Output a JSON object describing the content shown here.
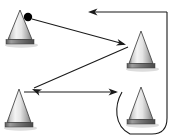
{
  "figure": {
    "width": 180,
    "height": 140,
    "background_color": "#ffffff",
    "line_color": "#1a1a1a",
    "dot_color": "#000000"
  },
  "cones": [
    {
      "id": "cone-top-left",
      "label": "Cone 1",
      "apex_x": 20,
      "apex_y": 10,
      "base_y": 44,
      "half_width": 12,
      "base_half_width": 14,
      "highlight_color": "#f2f2f2",
      "shade_color": "#8f8f8f",
      "base_color": "#6e6e6e"
    },
    {
      "id": "cone-mid-right",
      "label": "Cone 2",
      "apex_x": 141,
      "apex_y": 31,
      "base_y": 68,
      "half_width": 12,
      "base_half_width": 14,
      "highlight_color": "#f2f2f2",
      "shade_color": "#8f8f8f",
      "base_color": "#6e6e6e"
    },
    {
      "id": "cone-bottom-left",
      "label": "Cone 3",
      "apex_x": 19,
      "apex_y": 89,
      "base_y": 127,
      "half_width": 12,
      "base_half_width": 14,
      "highlight_color": "#f2f2f2",
      "shade_color": "#8f8f8f",
      "base_color": "#6e6e6e"
    },
    {
      "id": "cone-bottom-right",
      "label": "Cone 4",
      "apex_x": 141,
      "apex_y": 87,
      "base_y": 124,
      "half_width": 12,
      "base_half_width": 14,
      "highlight_color": "#f2f2f2",
      "shade_color": "#8f8f8f",
      "base_color": "#6e6e6e"
    }
  ],
  "start_marker": {
    "id": "start-dot",
    "label": "Start point",
    "cx": 28,
    "cy": 17,
    "r": 4.2
  },
  "segments": [
    {
      "id": "segment-1",
      "label": "Start to cone 2",
      "path": "M 32 19 L 124 44",
      "arrow_tip_x": 126,
      "arrow_tip_y": 44.7,
      "arrow_angle_deg": 15,
      "has_arrow": true
    },
    {
      "id": "segment-2",
      "label": "Cone 2 to cone 3",
      "path": "M 128 47 L 34 88",
      "arrow_tip_x": 32,
      "arrow_tip_y": 88.9,
      "arrow_angle_deg": 203.6,
      "has_arrow": true
    },
    {
      "id": "segment-3",
      "label": "Cone 3 to cone 4 loop entry",
      "path": "M 24 92 L 116 92",
      "arrow_tip_x": 118,
      "arrow_tip_y": 92,
      "arrow_angle_deg": 0,
      "has_arrow": true
    },
    {
      "id": "segment-4",
      "label": "Loop around cone 4 and up right side",
      "path": "M 122 92 C 114 106 114 126 130 134 L 152 134 C 164 134 167 126 167 118 L 167 12",
      "has_arrow": false
    },
    {
      "id": "segment-5",
      "label": "Return line to start, arrow pointing left",
      "path": "M 167 12 L 92 12",
      "arrow_tip_x": 88,
      "arrow_tip_y": 12,
      "arrow_angle_deg": 180,
      "has_arrow": true
    }
  ]
}
